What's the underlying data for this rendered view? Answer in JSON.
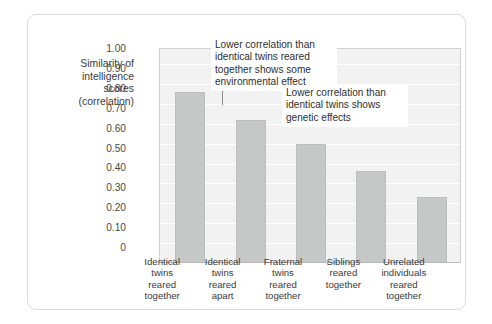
{
  "chart_data": {
    "type": "bar",
    "title": "",
    "subtitle": "",
    "xlabel": "",
    "ylabel": "Similarity of\nintelligence\nscores\n(correlation)",
    "ylim": [
      0,
      1.0
    ],
    "grid": true,
    "legend": null,
    "legend_position": "none",
    "bar_color": "#c6c8c8",
    "plot_background": "#f2f2f2",
    "categories": [
      "Identical\ntwins\nreared\ntogether",
      "Identical\ntwins\nreared\napart",
      "Fraternal\ntwins\nreared\ntogether",
      "Siblings\nreared\ntogether",
      "Unrelated\nindividuals\nreared\ntogether"
    ],
    "values": [
      0.86,
      0.72,
      0.6,
      0.46,
      0.33
    ],
    "ytick_labels": [
      "1.00",
      "0.90",
      "0.80",
      "0.70",
      "0.60",
      "0.50",
      "0.40",
      "0.30",
      "0.20",
      "0.10",
      "0"
    ],
    "ytick_values": [
      1.0,
      0.9,
      0.8,
      0.7,
      0.6,
      0.5,
      0.4,
      0.3,
      0.2,
      0.1,
      0
    ],
    "annotations": [
      {
        "text": "Lower correlation than\nidentical twins reared\ntogether shows some\nenvironmental effect",
        "points_to_category": "Identical twins reared apart",
        "points_to_value": 0.72
      },
      {
        "text": "Lower correlation than\nidentical twins shows\ngenetic effects",
        "points_to_category": "Fraternal twins reared together",
        "points_to_value": 0.6
      }
    ]
  }
}
